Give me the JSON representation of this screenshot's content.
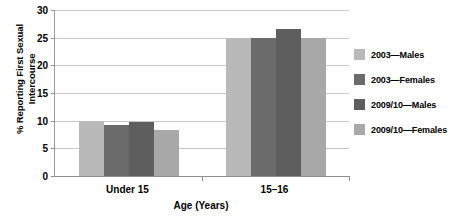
{
  "chart_data": {
    "type": "bar",
    "title": "",
    "xlabel": "Age (Years)",
    "ylabel": "% Reporting First Sexual Intercourse",
    "ylabel_line1": "% Reporting First Sexual",
    "ylabel_line2": "Intercourse",
    "categories": [
      "Under 15",
      "15–16"
    ],
    "ylim": [
      0,
      30
    ],
    "yticks": [
      0,
      5,
      10,
      15,
      20,
      25,
      30
    ],
    "ytick_labels": [
      "0",
      "5",
      "10",
      "15",
      "20",
      "25",
      "30"
    ],
    "grid": true,
    "legend_position": "right",
    "series": [
      {
        "name": "2003—Males",
        "color": "#b9b9b9",
        "values": [
          9.9,
          25.0
        ]
      },
      {
        "name": "2003—Females",
        "color": "#6b6b6b",
        "values": [
          9.3,
          24.9
        ]
      },
      {
        "name": "2009/10—Males",
        "color": "#5e5e5e",
        "values": [
          9.7,
          26.6
        ]
      },
      {
        "name": "2009/10—Females",
        "color": "#a8a8a8",
        "values": [
          8.3,
          25.0
        ]
      }
    ]
  },
  "colors": {
    "gridline": "#c9c9c9",
    "axis": "#8f8f8f",
    "text": "#000000",
    "background": "#ffffff"
  }
}
